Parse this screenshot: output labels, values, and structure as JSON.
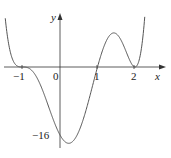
{
  "chart_data": {
    "type": "line",
    "title": "",
    "xlabel": "x",
    "ylabel": "y",
    "function_description": "polynomial with roots at x=-1 (inflection, touching), x=1 (crossing), x=2 (tangent); minimum near (0,-16)",
    "x_ticks": [
      -1,
      0,
      1,
      2
    ],
    "x_tick_labels": [
      "-1",
      "0",
      "1",
      "2"
    ],
    "y_ticks": [
      -16
    ],
    "y_tick_labels": [
      "-16"
    ],
    "key_points": [
      {
        "x": -1,
        "y": 0
      },
      {
        "x": 0,
        "y": -16
      },
      {
        "x": 1,
        "y": 0
      },
      {
        "x": 1.3,
        "y": 1.5
      },
      {
        "x": 2,
        "y": 0
      }
    ],
    "xlim": [
      -1.5,
      2.6
    ],
    "ylim": [
      -18,
      14
    ],
    "grid": false,
    "legend": null
  },
  "labels": {
    "x_axis": "x",
    "y_axis": "y",
    "tick_neg1": "−1",
    "tick_0": "0",
    "tick_1": "1",
    "tick_2": "2",
    "tick_neg16": "−16"
  },
  "colors": {
    "curve": "#555555",
    "axes": "#333333"
  }
}
